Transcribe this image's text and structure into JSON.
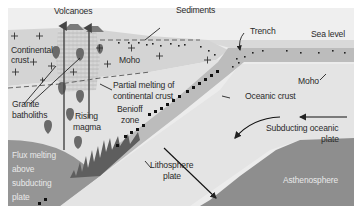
{
  "diagram": {
    "colors": {
      "sky": "#efefef",
      "continental_crust": "#d6d6d6",
      "mantle_wedge": "#e4e4e4",
      "oceanic_crust": "#bdbdbd",
      "lithosphere": "#e2e2e2",
      "asthenosphere": "#8f8f8f",
      "flux_melting": "#969696",
      "magma": "#6a6a6a",
      "text": "#2b2b2b",
      "text_on_dark": "#e9e9e9"
    },
    "labels": {
      "volcanoes": "Volcanoes",
      "sediments": "Sediments",
      "trench": "Trench",
      "sea_level": "Sea level",
      "continental_crust_line1": "Continental",
      "continental_crust_line2": "crust",
      "moho_left": "Moho",
      "moho_right": "Moho",
      "partial_melting_line1": "Partial melting of",
      "partial_melting_line2": "continental crust",
      "granite_batholiths_line1": "Granite",
      "granite_batholiths_line2": "batholiths",
      "rising_magma_line1": "Rising",
      "rising_magma_line2": "magma",
      "benioff_zone_line1": "Benioff",
      "benioff_zone_line2": "zone",
      "oceanic_crust": "Oceanic crust",
      "subducting_plate_line1": "Subducting oceanic",
      "subducting_plate_line2": "plate",
      "lithosphere_plate_line1": "Lithosphere",
      "lithosphere_plate_line2": "plate",
      "asthenosphere": "Asthenosphere",
      "flux_melting_line1": "Flux melting",
      "flux_melting_line2": "above",
      "flux_melting_line3": "subducting",
      "flux_melting_line4": "plate"
    },
    "symbols": {
      "plus": "granite-plus-symbol",
      "x_mark": "benioff-earthquake-marker",
      "dot": "sediment-dot"
    }
  }
}
